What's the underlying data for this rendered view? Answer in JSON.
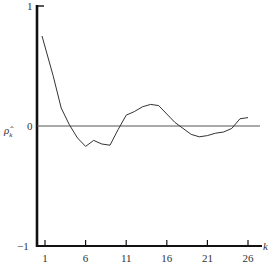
{
  "chart_data": {
    "type": "line",
    "title": "",
    "xlabel": "k",
    "ylabel": "ρ̂ₖ",
    "ylabel_main": "ρ̂",
    "ylabel_sub": "k",
    "xlim": [
      0,
      28
    ],
    "ylim": [
      -1,
      1
    ],
    "x_ticks": [
      1,
      6,
      11,
      16,
      21,
      26
    ],
    "x_tick_labels": [
      "1",
      "6",
      "11",
      "16",
      "21",
      "26"
    ],
    "y_tick_labels": {
      "top": "1",
      "zero": "0",
      "bottom": "−1"
    },
    "grid": false,
    "zero_line": true,
    "series": [
      {
        "name": "sample autocorrelation",
        "x": [
          1,
          2,
          3,
          4,
          5,
          6,
          7,
          8,
          9,
          10,
          11,
          12,
          13,
          14,
          15,
          16,
          17,
          18,
          19,
          20,
          21,
          22,
          23,
          24,
          25,
          26
        ],
        "values": [
          0.75,
          0.42,
          0.15,
          0.01,
          -0.1,
          -0.17,
          -0.12,
          -0.15,
          -0.16,
          -0.03,
          0.09,
          0.12,
          0.16,
          0.18,
          0.17,
          0.1,
          0.03,
          -0.02,
          -0.07,
          -0.09,
          -0.08,
          -0.06,
          -0.05,
          -0.02,
          0.06,
          0.07
        ]
      }
    ]
  }
}
